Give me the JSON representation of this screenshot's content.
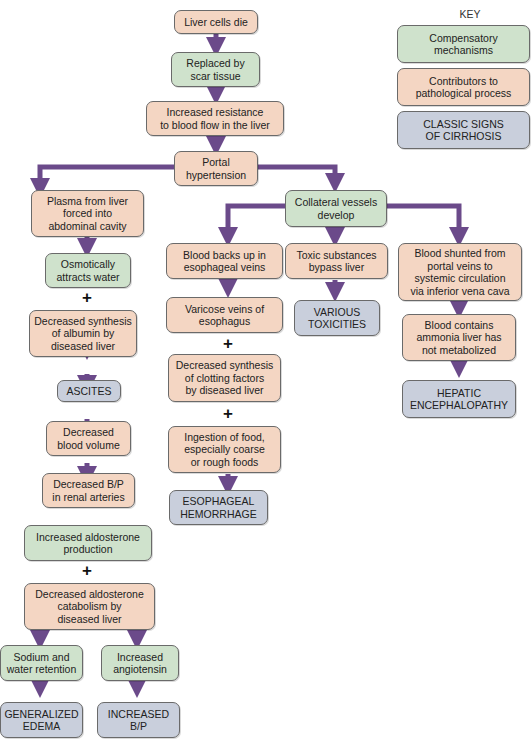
{
  "key": {
    "title": "KEY",
    "items": [
      {
        "label": "Compensatory\nmechanisms",
        "type": "comp"
      },
      {
        "label": "Contributors to\npathological process",
        "type": "contrib"
      },
      {
        "label": "CLASSIC SIGNS\nOF CIRRHOSIS",
        "type": "sign"
      }
    ]
  },
  "colors": {
    "contributor": "#f4d6c3",
    "compensatory": "#cfe2cc",
    "classic_sign": "#c9cfdc",
    "arrow": "#6b4a8a"
  },
  "nodes": {
    "liver_cells_die": "Liver cells die",
    "replaced_by_scar": "Replaced by\nscar tissue",
    "increased_resistance": "Increased resistance\nto blood flow in the liver",
    "portal_hypertension": "Portal\nhypertension",
    "plasma_forced": "Plasma from liver\nforced into\nabdominal cavity",
    "osmotically_attracts": "Osmotically\nattracts water",
    "decreased_albumin": "Decreased synthesis\nof albumin by\ndiseased liver",
    "ascites": "ASCITES",
    "decreased_blood_volume": "Decreased\nblood volume",
    "decreased_bp_renal": "Decreased B/P\nin renal arteries",
    "increased_aldosterone": "Increased aldosterone\nproduction",
    "decreased_aldosterone_catabolism": "Decreased aldosterone\ncatabolism by\ndiseased liver",
    "sodium_water_retention": "Sodium and\nwater retention",
    "increased_angiotensin": "Increased\nangiotensin",
    "generalized_edema": "GENERALIZED\nEDEMA",
    "increased_bp": "INCREASED\nB/P",
    "collateral_vessels": "Collateral vessels\ndevelop",
    "blood_backs_up": "Blood backs up in\nesophageal veins",
    "varicose_veins": "Varicose veins of\nesophagus",
    "decreased_clotting": "Decreased synthesis\nof clotting factors\nby diseased liver",
    "ingestion_food": "Ingestion of food,\nespecially coarse\nor rough foods",
    "esophageal_hemorrhage": "ESOPHAGEAL\nHEMORRHAGE",
    "toxic_bypass": "Toxic substances\nbypass liver",
    "various_toxicities": "VARIOUS\nTOXICITIES",
    "blood_shunted": "Blood shunted from\nportal veins to\nsystemic circulation\nvia inferior vena cava",
    "blood_ammonia": "Blood contains\nammonia liver has\nnot metabolized",
    "hepatic_encephalopathy": "HEPATIC\nENCEPHALOPATHY"
  },
  "plus_sign": "+"
}
